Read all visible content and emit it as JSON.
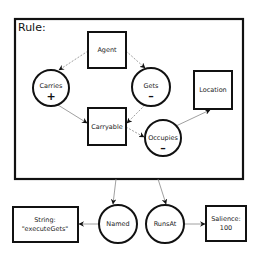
{
  "rule": {
    "title": "Rule:"
  },
  "nodes": {
    "agent": {
      "label": "Agent",
      "shape": "box"
    },
    "carries": {
      "label": "Carries",
      "shape": "circle",
      "sign": "+"
    },
    "gets": {
      "label": "Gets",
      "shape": "circle",
      "sign": "–"
    },
    "location": {
      "label": "Location",
      "shape": "box"
    },
    "carryable": {
      "label": "Carryable",
      "shape": "box"
    },
    "occupies": {
      "label": "Occupies",
      "shape": "circle",
      "sign": "–"
    },
    "named": {
      "label": "Named",
      "shape": "circle"
    },
    "runsat": {
      "label": "RunsAt",
      "shape": "circle"
    },
    "string": {
      "line1": "String:",
      "line2": "\"executeGets\"",
      "shape": "box"
    },
    "salience": {
      "line1": "Salience:",
      "line2": "100",
      "shape": "box"
    }
  },
  "edges": [
    {
      "from": "Agent",
      "to": "Carries",
      "style": "dashed"
    },
    {
      "from": "Agent",
      "to": "Gets",
      "style": "dashed"
    },
    {
      "from": "Carries",
      "to": "Carryable",
      "style": "solid"
    },
    {
      "from": "Gets",
      "to": "Carryable",
      "style": "dashed"
    },
    {
      "from": "Carryable",
      "to": "Occupies",
      "style": "dashed"
    },
    {
      "from": "Occupies",
      "to": "Location",
      "style": "solid"
    },
    {
      "from": "Rule",
      "to": "Named",
      "style": "solid"
    },
    {
      "from": "Rule",
      "to": "RunsAt",
      "style": "solid"
    },
    {
      "from": "Named",
      "to": "String",
      "style": "solid"
    },
    {
      "from": "RunsAt",
      "to": "Salience",
      "style": "solid"
    }
  ]
}
